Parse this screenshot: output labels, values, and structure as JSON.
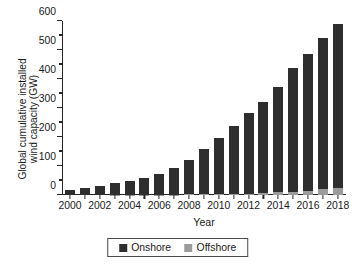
{
  "chart_data": {
    "type": "bar",
    "title": "",
    "subtitle": "",
    "xlabel": "Year",
    "ylabel": "Global cumulative installed wind capacity (GW)",
    "ylabel_lines": [
      "Global cumulative installed",
      "wind capacity (GW)"
    ],
    "stacked": true,
    "grid": false,
    "legend_position": "bottom-center",
    "ylim": [
      0,
      600
    ],
    "y_ticks": [
      0,
      100,
      200,
      300,
      400,
      500,
      600
    ],
    "y_tick_labels": [
      "0",
      "100",
      "200",
      "300",
      "400",
      "500",
      "600"
    ],
    "y_minor_ticks": [
      50,
      150,
      250,
      350,
      450,
      550
    ],
    "categories": [
      "2000",
      "2001",
      "2002",
      "2003",
      "2004",
      "2005",
      "2006",
      "2007",
      "2008",
      "2009",
      "2010",
      "2011",
      "2012",
      "2013",
      "2014",
      "2015",
      "2016",
      "2017",
      "2018"
    ],
    "x_tick_labels_shown": [
      "2000",
      "2002",
      "2004",
      "2006",
      "2008",
      "2010",
      "2012",
      "2014",
      "2016",
      "2018"
    ],
    "series": [
      {
        "name": "Onshore",
        "color": "#2e2e2e",
        "values": [
          17,
          23,
          31,
          39,
          47,
          58,
          73,
          92,
          119,
          157,
          195,
          234,
          278,
          314,
          362,
          425,
          473,
          521,
          568
        ]
      },
      {
        "name": "Offshore",
        "color": "#9b9b9b",
        "values": [
          0,
          0,
          0,
          1,
          1,
          1,
          1,
          1,
          2,
          2,
          3,
          4,
          5,
          7,
          9,
          12,
          15,
          20,
          23
        ]
      }
    ],
    "totals": [
      17,
      23,
      31,
      40,
      48,
      59,
      74,
      93,
      121,
      159,
      198,
      238,
      283,
      321,
      371,
      437,
      488,
      541,
      591
    ]
  },
  "legend": {
    "items": [
      {
        "label": "Onshore",
        "color": "#2e2e2e"
      },
      {
        "label": "Offshore",
        "color": "#9b9b9b"
      }
    ]
  }
}
